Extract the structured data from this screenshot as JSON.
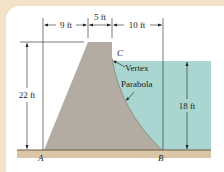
{
  "diagram": {
    "type": "dam cross-section",
    "dimensions": {
      "left_base_offset": "9 ft",
      "top_width": "5 ft",
      "right_offset": "10 ft",
      "dam_height": "22 ft",
      "water_depth": "18 ft"
    },
    "points": {
      "a": "A",
      "b": "B",
      "c": "C"
    },
    "annotations": {
      "vertex": "Vertex",
      "parabola": "Parabola"
    },
    "colors": {
      "outer_border": "#f4e3c8",
      "background": "#ffffff",
      "dam_fill": "#b3aca3",
      "water_fill": "#a9d6d0",
      "ground_fill": "#d9c6a6",
      "ground_line": "#6b5a44",
      "line": "#222222"
    }
  }
}
